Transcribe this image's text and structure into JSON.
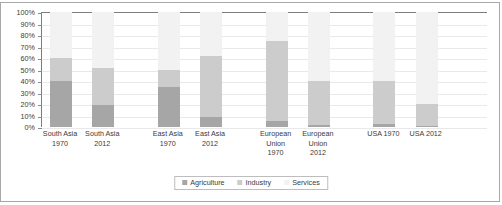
{
  "chart_data": {
    "type": "bar",
    "subtype": "100% stacked column",
    "title": "",
    "xlabel": "",
    "ylabel": "",
    "ylim": [
      0,
      100
    ],
    "grid": true,
    "legend_position": "bottom-center",
    "categories": [
      "South Asia 1970",
      "South Asia 2012",
      "East Asia 1970",
      "East Asia 2012",
      "European Union 1970",
      "European Union 2012",
      "USA 1970",
      "USA 2012"
    ],
    "category_lines": [
      [
        "South Asia",
        "1970"
      ],
      [
        "South Asia",
        "2012"
      ],
      [
        "East Asia",
        "1970"
      ],
      [
        "East Asia",
        "2012"
      ],
      [
        "European",
        "Union",
        "1970"
      ],
      [
        "European",
        "Union",
        "2012"
      ],
      [
        "USA 1970"
      ],
      [
        "USA 2012"
      ]
    ],
    "ytick_labels": [
      "100%",
      "90%",
      "80%",
      "70%",
      "60%",
      "50%",
      "40%",
      "30%",
      "20%",
      "10%",
      "0%"
    ],
    "ytick_values": [
      100,
      90,
      80,
      70,
      60,
      50,
      40,
      30,
      20,
      10,
      0
    ],
    "series": [
      {
        "name": "Agriculture",
        "color": "#a6a6a6",
        "values": [
          40,
          19,
          35,
          9,
          5,
          2,
          3,
          1
        ]
      },
      {
        "name": "Industry",
        "color": "#cccccc",
        "values": [
          20,
          32,
          15,
          53,
          70,
          38,
          37,
          19
        ]
      },
      {
        "name": "Services",
        "color": "#f2f2f2",
        "values": [
          40,
          49,
          50,
          38,
          25,
          60,
          60,
          80
        ]
      }
    ],
    "column_gaps_after": [
      1,
      3,
      5
    ],
    "colors": {
      "agriculture": "#a6a6a6",
      "industry": "#cccccc",
      "services": "#f2f2f2",
      "axis": "#7d7d7d",
      "gridline": "#e9e9e9",
      "frame": "#a8a8a8",
      "text": "#3a3a3a"
    }
  }
}
